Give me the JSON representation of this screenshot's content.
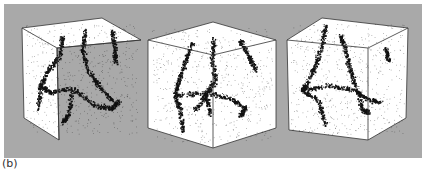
{
  "figure": {
    "panel_label": "(b)",
    "background_color": "#a9a9a9",
    "cube_face_color": "#ffffff",
    "point_color": "#111111",
    "cubes": [
      {
        "name": "cube-1",
        "outline": [
          [
            22,
            28
          ],
          [
            102,
            18
          ],
          [
            141,
            40
          ],
          [
            57,
            48
          ],
          [
            59,
            140
          ],
          [
            24,
            118
          ]
        ],
        "front_top": [
          57,
          48
        ],
        "front_bottom": [
          59,
          140
        ],
        "right_bottom": [
          140,
          130
        ],
        "right_top": [
          141,
          40
        ],
        "seed": 11,
        "filaments": [
          [
            [
              62,
              36
            ],
            [
              60,
              55
            ],
            [
              48,
              70
            ],
            [
              40,
              85
            ],
            [
              50,
              92
            ],
            [
              72,
              88
            ],
            [
              95,
              105
            ],
            [
              112,
              108
            ],
            [
              118,
              100
            ]
          ],
          [
            [
              85,
              30
            ],
            [
              82,
              50
            ],
            [
              88,
              70
            ],
            [
              98,
              85
            ],
            [
              112,
              100
            ]
          ],
          [
            [
              112,
              30
            ],
            [
              114,
              45
            ],
            [
              115,
              62
            ]
          ],
          [
            [
              40,
              85
            ],
            [
              38,
              110
            ]
          ],
          [
            [
              72,
              88
            ],
            [
              68,
              115
            ],
            [
              62,
              122
            ]
          ]
        ]
      },
      {
        "name": "cube-2",
        "outline": [
          [
            148,
            40
          ],
          [
            213,
            22
          ],
          [
            276,
            40
          ],
          [
            276,
            128
          ],
          [
            213,
            148
          ],
          [
            148,
            128
          ]
        ],
        "front_top": [
          213,
          55
        ],
        "front_bottom": [
          213,
          148
        ],
        "right_bottom": [
          276,
          128
        ],
        "right_top": [
          276,
          40
        ],
        "seed": 23,
        "filaments": [
          [
            [
              192,
              42
            ],
            [
              185,
              60
            ],
            [
              178,
              80
            ],
            [
              175,
              95
            ],
            [
              180,
              110
            ],
            [
              182,
              130
            ]
          ],
          [
            [
              213,
              38
            ],
            [
              212,
              60
            ],
            [
              215,
              80
            ],
            [
              205,
              95
            ],
            [
              195,
              110
            ]
          ],
          [
            [
              240,
              40
            ],
            [
              248,
              55
            ],
            [
              255,
              70
            ]
          ],
          [
            [
              175,
              95
            ],
            [
              205,
              92
            ],
            [
              230,
              98
            ],
            [
              245,
              108
            ],
            [
              240,
              115
            ]
          ],
          [
            [
              205,
              95
            ],
            [
              210,
              115
            ]
          ]
        ]
      },
      {
        "name": "cube-3",
        "outline": [
          [
            287,
            40
          ],
          [
            322,
            18
          ],
          [
            408,
            28
          ],
          [
            406,
            118
          ],
          [
            368,
            140
          ],
          [
            289,
            130
          ]
        ],
        "front_top": [
          368,
          48
        ],
        "front_bottom": [
          368,
          140
        ],
        "right_bottom": [
          406,
          118
        ],
        "right_top": [
          408,
          28
        ],
        "seed": 37,
        "filaments": [
          [
            [
              325,
              25
            ],
            [
              322,
              45
            ],
            [
              315,
              65
            ],
            [
              305,
              85
            ],
            [
              302,
              90
            ],
            [
              318,
              100
            ],
            [
              325,
              125
            ]
          ],
          [
            [
              340,
              35
            ],
            [
              345,
              50
            ],
            [
              350,
              70
            ],
            [
              355,
              85
            ]
          ],
          [
            [
              305,
              90
            ],
            [
              330,
              85
            ],
            [
              355,
              90
            ],
            [
              365,
              98
            ],
            [
              380,
              102
            ]
          ],
          [
            [
              355,
              85
            ],
            [
              362,
              110
            ],
            [
              368,
              112
            ]
          ],
          [
            [
              385,
              48
            ],
            [
              388,
              60
            ]
          ]
        ]
      }
    ]
  }
}
